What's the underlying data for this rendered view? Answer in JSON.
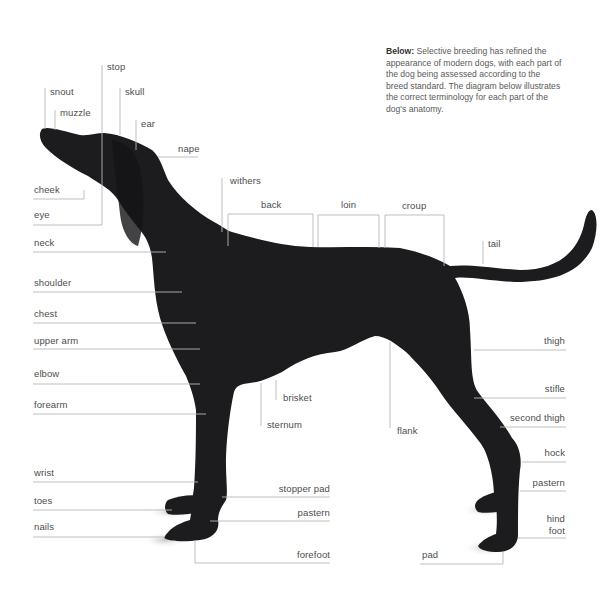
{
  "caption": {
    "lead": "Below:",
    "body": "Selective breeding has refined the appearance of modern dogs, with each part of the dog being assessed according to the breed standard. The diagram below illustrates the correct terminology for each part of the dog's anatomy."
  },
  "colors": {
    "background": "#ffffff",
    "dog": "#1c1c1e",
    "leader_line": "#b8b8b8",
    "label_text": "#4d4d4d"
  },
  "labels": {
    "snout": "snout",
    "muzzle": "muzzle",
    "stop": "stop",
    "skull": "skull",
    "ear": "ear",
    "nape": "nape",
    "cheek": "cheek",
    "eye": "eye",
    "neck": "neck",
    "withers": "withers",
    "back": "back",
    "loin": "loin",
    "croup": "croup",
    "tail": "tail",
    "shoulder": "shoulder",
    "chest": "chest",
    "upper_arm": "upper arm",
    "elbow": "elbow",
    "forearm": "forearm",
    "brisket": "brisket",
    "sternum": "sternum",
    "flank": "flank",
    "thigh": "thigh",
    "stifle": "stifle",
    "second_thigh": "second thigh",
    "hock": "hock",
    "rear_pastern": "pastern",
    "hind_foot_line1": "hind",
    "hind_foot_line2": "foot",
    "pad": "pad",
    "wrist": "wrist",
    "toes": "toes",
    "nails": "nails",
    "stopper_pad": "stopper pad",
    "front_pastern": "pastern",
    "forefoot": "forefoot"
  }
}
